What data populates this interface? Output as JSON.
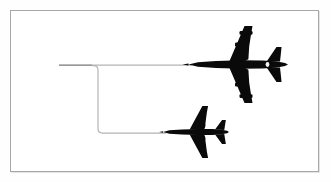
{
  "figure": {
    "background_color": "#ffffff",
    "outer_background_color": "#fefefe",
    "frame": {
      "border_color": "#a8a8a8",
      "border_width_px": 1,
      "x": 10,
      "y": 10,
      "width": 309,
      "height": 162
    },
    "silhouette_color": "#0a0a0a",
    "trail_color": "#b4b4b4",
    "trail_width_px": 1.2
  },
  "aircraft": [
    {
      "id": "large-aircraft",
      "label": "Large four-engine jet aircraft",
      "engine_count": 4,
      "heading": "left",
      "color": "#0a0a0a",
      "center_x": 236,
      "center_y": 64,
      "nose_x": 190,
      "tail_x": 288,
      "wingspan_px": 78,
      "length_px": 98,
      "scale": 1.0
    },
    {
      "id": "small-aircraft",
      "label": "Small twin-engine jet aircraft",
      "engine_count": 2,
      "heading": "left",
      "color": "#0a0a0a",
      "center_x": 196,
      "center_y": 132,
      "nose_x": 163,
      "tail_x": 226,
      "wingspan_px": 50,
      "length_px": 63,
      "scale": 0.63
    }
  ],
  "trails": [
    {
      "id": "upper-trail",
      "label": "Upper flight path to large aircraft",
      "color": "#b4b4b4",
      "start_x": 59,
      "start_y": 65,
      "end_x": 192,
      "end_y": 65,
      "style": "straight"
    },
    {
      "id": "branch-trail",
      "label": "Branching flight path to small aircraft",
      "color": "#b4b4b4",
      "branch_x": 98,
      "branch_top_y": 65,
      "branch_bottom_y": 133,
      "end_x": 166,
      "end_y": 133,
      "corner_radius_px": 6,
      "style": "stepped"
    }
  ],
  "a11y": {
    "description": "Black silhouettes of two jet aircraft flying left, linked by thin grey trajectory lines that split from one horizontal path into an upper path leading to the large four-engine aircraft and a lower stepped path leading to the smaller twin-engine aircraft."
  }
}
